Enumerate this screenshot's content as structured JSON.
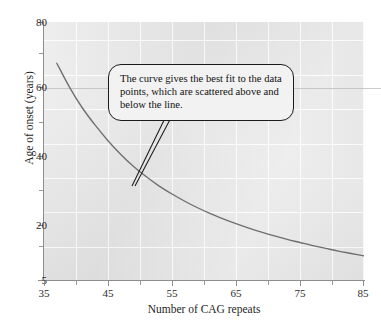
{
  "figure": {
    "annotation": {
      "text": "The curve gives the best fit to the data points, which are scattered above and below the line."
    }
  },
  "chart_data": {
    "type": "line",
    "title": "",
    "subtitle": "",
    "xlabel": "Number of CAG repeats",
    "ylabel": "Age of onset (years)",
    "xlim": [
      35,
      85
    ],
    "ylim": [
      5,
      80
    ],
    "xticks": [
      35,
      45,
      55,
      65,
      75,
      85
    ],
    "yticks": [
      5,
      20,
      40,
      60,
      80
    ],
    "x_minor_step": 5,
    "y_minor_step": 10,
    "grid": true,
    "grid_color": "#fdfdfd",
    "plot_background": "#e4e4e4",
    "legend": null,
    "series": [
      {
        "name": "best-fit curve",
        "color": "#6e6e6e",
        "x": [
          37,
          39,
          41,
          43,
          45,
          47,
          49,
          51,
          53,
          55,
          57,
          59,
          61,
          63,
          65,
          67,
          69,
          71,
          73,
          75,
          77,
          79,
          81,
          83,
          85
        ],
        "y": [
          68,
          61,
          55,
          50,
          45.5,
          41.5,
          38,
          35,
          32.3,
          30,
          27.9,
          26,
          24.3,
          22.8,
          21.4,
          20.1,
          18.9,
          17.8,
          16.8,
          15.9,
          15.0,
          14.2,
          13.4,
          12.7,
          12.0
        ]
      }
    ],
    "annotations": [
      {
        "text": "The curve gives the best fit to the data points, which are scattered above and below the line.",
        "points_to_x": 52,
        "points_to_y": 33
      }
    ]
  },
  "axes": {
    "y_tick_labels": [
      "80",
      "60",
      "40",
      "20",
      "5"
    ],
    "x_tick_labels": [
      "35",
      "45",
      "55",
      "65",
      "75",
      "85"
    ],
    "y_title": "Age of onset (years)",
    "x_title": "Number of CAG repeats"
  }
}
